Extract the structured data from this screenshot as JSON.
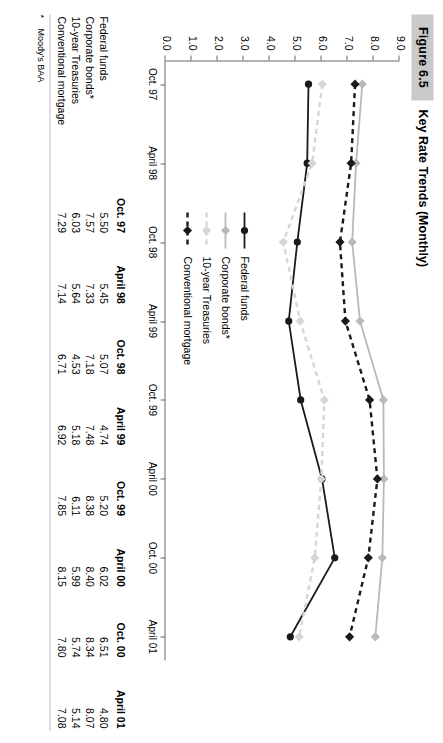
{
  "figure": {
    "number": "Figure 6.5",
    "title": "Key Rate Trends (Monthly)"
  },
  "footnote": {
    "marker": "*",
    "text": "Moody's BAA"
  },
  "chart_data": {
    "type": "line",
    "title": "Key Rate Trends (Monthly)",
    "xlabel": "",
    "ylabel": "",
    "grid": false,
    "legend_position": "inside-lower-left",
    "categories": [
      "Oct. 97",
      "April 98",
      "Oct. 98",
      "April 99",
      "Oct. 99",
      "April 00",
      "Oct. 00",
      "April 01"
    ],
    "ylim": [
      0.0,
      9.0
    ],
    "yticks": [
      "0.0",
      "1.0",
      "2.0",
      "3.0",
      "4.0",
      "5.0",
      "6.0",
      "7.0",
      "8.0",
      "9.0"
    ],
    "series": [
      {
        "name": "Federal funds",
        "color": "#1a1a1a",
        "style": "solid",
        "marker": "circle",
        "values": [
          5.5,
          5.45,
          5.07,
          4.74,
          5.2,
          6.02,
          6.51,
          4.8
        ]
      },
      {
        "name": "Corporate bonds*",
        "color": "#b9b9b9",
        "style": "solid",
        "marker": "diamond",
        "values": [
          7.57,
          7.33,
          7.18,
          7.48,
          8.38,
          8.4,
          8.34,
          8.07
        ]
      },
      {
        "name": "10-year Treasuries",
        "color": "#d6d6d6",
        "style": "dashed",
        "marker": "diamond",
        "values": [
          6.03,
          5.64,
          4.53,
          5.18,
          6.11,
          5.99,
          5.74,
          5.14
        ]
      },
      {
        "name": "Conventional mortgage",
        "color": "#1a1a1a",
        "style": "dashed",
        "marker": "diamond",
        "values": [
          7.29,
          7.14,
          6.71,
          6.92,
          7.85,
          8.15,
          7.8,
          7.08
        ]
      }
    ]
  },
  "legend": {
    "items": [
      {
        "label": "Federal funds"
      },
      {
        "label": "Corporate bonds*"
      },
      {
        "label": "10-year Treasuries"
      },
      {
        "label": "Conventional mortgage"
      }
    ]
  },
  "table": {
    "corner": "",
    "columns": [
      "Oct. 97",
      "April 98",
      "Oct. 98",
      "April 99",
      "Oct. 99",
      "April 00",
      "Oct. 00",
      "April 01"
    ],
    "rows": [
      {
        "label": "Federal funds",
        "values": [
          "5.50",
          "5.45",
          "5.07",
          "4.74",
          "5.20",
          "6.02",
          "6.51",
          "4.80"
        ]
      },
      {
        "label": "Corporate bonds*",
        "values": [
          "7.57",
          "7.33",
          "7.18",
          "7.48",
          "8.38",
          "8.40",
          "8.34",
          "8.07"
        ]
      },
      {
        "label": "10-year Treasuries",
        "values": [
          "6.03",
          "5.64",
          "4.53",
          "5.18",
          "6.11",
          "5.99",
          "5.74",
          "5.14"
        ]
      },
      {
        "label": "Conventional mortgage",
        "values": [
          "7.29",
          "7.14",
          "6.71",
          "6.92",
          "7.85",
          "8.15",
          "7.80",
          "7.08"
        ]
      }
    ]
  }
}
